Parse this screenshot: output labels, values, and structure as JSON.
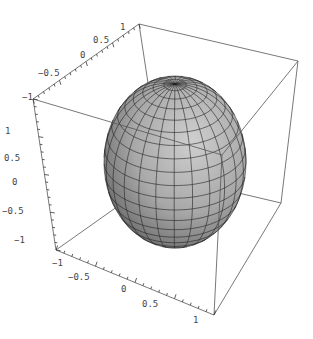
{
  "chart_data": {
    "type": "surface3d",
    "title": "",
    "surface": {
      "shape": "sphere",
      "radius": 1,
      "center": [
        0,
        0,
        0
      ],
      "mesh": {
        "latitude_divisions": 20,
        "longitude_divisions": 24
      },
      "colors": {
        "light": "#c8c8c8",
        "mid": "#9a9a9a",
        "dark": "#4a4a4a",
        "mesh": "#222222"
      }
    },
    "box": {
      "visible": true,
      "edge_color": "#555555"
    },
    "axes": {
      "x": {
        "range": [
          -1,
          1
        ],
        "ticks": [
          -1,
          -0.5,
          0,
          0.5,
          1
        ],
        "tick_labels": [
          "-1",
          "-0.5",
          "0",
          "0.5",
          "1"
        ],
        "label": ""
      },
      "y": {
        "range": [
          -1,
          1
        ],
        "ticks": [
          -1,
          -0.5,
          0,
          0.5,
          1
        ],
        "tick_labels": [
          "-1",
          "-0.5",
          "0",
          "0.5",
          "1"
        ],
        "label": ""
      },
      "z": {
        "range": [
          -1,
          1
        ],
        "ticks": [
          -1,
          -0.5,
          0,
          0.5,
          1
        ],
        "tick_labels": [
          "-1",
          "-0.5",
          "0",
          "0.5",
          "1"
        ],
        "label": ""
      }
    },
    "grid": false,
    "legend": null
  },
  "layout": {
    "corners": {
      "top_front_left": [
        33,
        99
      ],
      "top_back_left": [
        139,
        24
      ],
      "top_back_right": [
        298,
        61
      ],
      "top_front_right": [
        222,
        155
      ],
      "bottom_front_left": [
        56,
        250
      ],
      "bottom_back_left": [
        162,
        175
      ],
      "bottom_back_right": [
        281,
        203
      ],
      "bottom_front_right": [
        214,
        315
      ]
    },
    "sphere_ellipse": {
      "cx": 175,
      "cy": 162,
      "rx": 71,
      "ry": 86,
      "pole_y": 84
    },
    "tick_label_positions": {
      "top_axis": [
        [
          22,
          100
        ],
        [
          38,
          76
        ],
        [
          80,
          58
        ],
        [
          93,
          43
        ],
        [
          120,
          30
        ]
      ],
      "vertical_axis": [
        [
          5,
          134
        ],
        [
          4,
          161
        ],
        [
          12,
          185
        ],
        [
          2,
          214
        ],
        [
          14,
          243
        ]
      ],
      "bottom_axis": [
        [
          52,
          266
        ],
        [
          68,
          280
        ],
        [
          121,
          292
        ],
        [
          142,
          307
        ],
        [
          193,
          323
        ]
      ]
    }
  }
}
